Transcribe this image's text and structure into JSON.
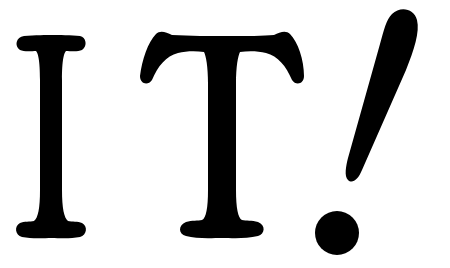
{
  "text": {
    "content": "IT!",
    "letters": [
      "I",
      "T",
      "!"
    ]
  },
  "colors": {
    "background": "#ffffff",
    "text": "#000000"
  }
}
